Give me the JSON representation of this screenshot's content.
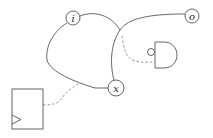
{
  "diagram": {
    "type": "circuit-graph",
    "colors": {
      "stroke": "#555555",
      "dashed": "#888888",
      "background": "#ffffff"
    },
    "nodes": [
      {
        "id": "i",
        "label": "i"
      },
      {
        "id": "o",
        "label": "o"
      },
      {
        "id": "x",
        "label": "x"
      }
    ],
    "components": [
      {
        "id": "and-gate",
        "kind": "AND gate with inverted input bubble"
      },
      {
        "id": "flip-flop",
        "kind": "register with clock input"
      }
    ],
    "edges": [
      {
        "from": "i",
        "to": "x",
        "style": "solid",
        "route": "left loop"
      },
      {
        "from": "i",
        "to": "crossing",
        "style": "solid"
      },
      {
        "from": "x",
        "to": "o",
        "style": "solid"
      },
      {
        "from": "crossing",
        "to": "and-gate",
        "style": "dashed"
      },
      {
        "from": "flip-flop",
        "to": "i-x-edge",
        "style": "dashed"
      }
    ]
  }
}
